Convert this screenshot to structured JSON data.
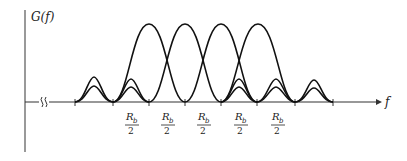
{
  "diagram": {
    "y_axis_label": "G(f)",
    "x_axis_label": "f",
    "axis_break_symbol": "≀≀",
    "tick_label_numerator": "R",
    "tick_label_subscript": "b",
    "tick_label_denominator": "2",
    "tick_labels": [
      "Rb/2",
      "Rb/2",
      "Rb/2",
      "Rb/2",
      "Rb/2"
    ],
    "colors": {
      "stroke": "#111111",
      "axis": "#333333"
    }
  }
}
